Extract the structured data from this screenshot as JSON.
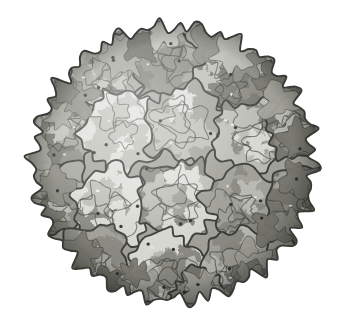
{
  "figure": {
    "rendering_style": "space-filling molecular surface, grayscale",
    "background_color": "#ffffff",
    "symmetry": "icosahedral",
    "view": "five-fold axis toward viewer, slightly off-axis"
  },
  "palette": {
    "background": "#ffffff",
    "highlight": "#ededea",
    "light_gray": "#e2e2dd",
    "mid_light_gray": "#c2c2bb",
    "mid_gray": "#a6a69e",
    "mid_dark_gray": "#8d8d85",
    "dark_gray": "#7a7a72",
    "darker_gray": "#6a6a63",
    "outline": "#3a3a36",
    "dot": "#2e2e2b",
    "rim_shadow": "#55554f"
  },
  "geometry": {
    "sphere_center_x": 174,
    "sphere_center_y": 163,
    "sphere_radius_x": 146,
    "sphere_radius_y": 143,
    "bounds": {
      "left": 28,
      "top": 20,
      "right": 320,
      "bottom": 306
    },
    "outline_stroke_width": 1.9,
    "inner_stroke_width": 1.1,
    "lumpy_edge_bumps": 44
  },
  "capsomeres": {
    "count_visible": 17,
    "description": "Irregular polygonal protein subunit tiles outlined in dark gray, each filled with mottled light, medium and dark gray domains",
    "tiles": [
      {
        "id": "tile-top-left",
        "cx": 104,
        "cy": 72,
        "r": 44,
        "rot": 12,
        "sides": 5,
        "tone": "mid_gray"
      },
      {
        "id": "tile-top-center",
        "cx": 168,
        "cy": 60,
        "r": 42,
        "rot": -18,
        "sides": 5,
        "tone": "mid_dark_gray"
      },
      {
        "id": "tile-top-right",
        "cx": 238,
        "cy": 74,
        "r": 44,
        "rot": 24,
        "sides": 5,
        "tone": "dark_gray"
      },
      {
        "id": "tile-upper-left",
        "cx": 62,
        "cy": 132,
        "r": 42,
        "rot": -8,
        "sides": 5,
        "tone": "dark_gray"
      },
      {
        "id": "tile-mid-upper-left",
        "cx": 122,
        "cy": 131,
        "r": 44,
        "rot": 30,
        "sides": 5,
        "tone": "light_gray"
      },
      {
        "id": "tile-center-upper",
        "cx": 186,
        "cy": 124,
        "r": 46,
        "rot": -6,
        "sides": 5,
        "tone": "mid_gray"
      },
      {
        "id": "tile-mid-upper-right",
        "cx": 252,
        "cy": 136,
        "r": 44,
        "rot": 16,
        "sides": 5,
        "tone": "mid_light_gray"
      },
      {
        "id": "tile-upper-right",
        "cx": 300,
        "cy": 128,
        "r": 38,
        "rot": -22,
        "sides": 5,
        "tone": "dark_gray"
      },
      {
        "id": "tile-left",
        "cx": 54,
        "cy": 196,
        "r": 40,
        "rot": 18,
        "sides": 5,
        "tone": "mid_gray"
      },
      {
        "id": "tile-mid-left",
        "cx": 112,
        "cy": 204,
        "r": 45,
        "rot": -14,
        "sides": 5,
        "tone": "light_gray"
      },
      {
        "id": "tile-center",
        "cx": 178,
        "cy": 200,
        "r": 46,
        "rot": 8,
        "sides": 5,
        "tone": "mid_dark_gray"
      },
      {
        "id": "tile-mid-right",
        "cx": 244,
        "cy": 206,
        "r": 44,
        "rot": -26,
        "sides": 5,
        "tone": "mid_gray"
      },
      {
        "id": "tile-right",
        "cx": 300,
        "cy": 202,
        "r": 38,
        "rot": 14,
        "sides": 5,
        "tone": "dark_gray"
      },
      {
        "id": "tile-bottom-left",
        "cx": 92,
        "cy": 262,
        "r": 42,
        "rot": 22,
        "sides": 5,
        "tone": "mid_dark_gray"
      },
      {
        "id": "tile-bottom-center",
        "cx": 164,
        "cy": 270,
        "r": 44,
        "rot": -10,
        "sides": 5,
        "tone": "light_gray"
      },
      {
        "id": "tile-bottom-right",
        "cx": 238,
        "cy": 262,
        "r": 42,
        "rot": 6,
        "sides": 5,
        "tone": "mid_gray"
      },
      {
        "id": "tile-far-bottom",
        "cx": 196,
        "cy": 296,
        "r": 30,
        "rot": -30,
        "sides": 5,
        "tone": "dark_gray"
      }
    ]
  },
  "surface_detail": {
    "domain_blob_count": 150,
    "pit_dot_count": 34,
    "pit_dot_radius": 1.7,
    "specular_speck_count": 12,
    "speck_color": "#f4f4f1"
  },
  "labels": {
    "figure_caption": ""
  }
}
